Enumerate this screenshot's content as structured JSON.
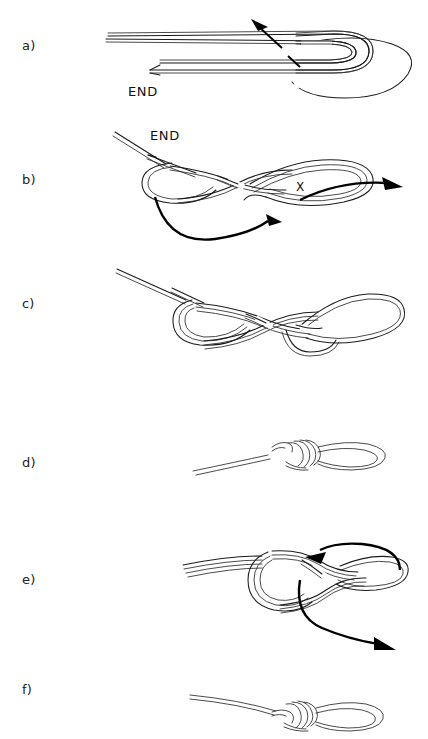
{
  "document": {
    "type": "instructional-line-diagram",
    "subject": "knot tying sequence",
    "clipped_top_caption": "",
    "background_color": "#ffffff",
    "ink_color": "#1b1b1b"
  },
  "panels": [
    {
      "id": "a",
      "label": "a)",
      "label_x": 22,
      "label_y": 38,
      "description": "Doubled rope laid out as a long bight with a loop formed at the right end; free end folded back to the left.",
      "annotations": [
        {
          "name": "end-label",
          "text": "END",
          "x": 128,
          "y": 84
        }
      ],
      "arrows": [
        {
          "name": "pull-arrow",
          "style": "straight",
          "direction": "up-left"
        }
      ]
    },
    {
      "id": "b",
      "label": "b)",
      "label_x": 22,
      "label_y": 172,
      "description": "Doubled rope twisted into interlocking figure-eight crossings; large bight extends to the right.",
      "annotations": [
        {
          "name": "end-label",
          "text": "END",
          "x": 150,
          "y": 128
        },
        {
          "name": "x-marker",
          "text": "X",
          "x": 296,
          "y": 181
        }
      ],
      "arrows": [
        {
          "name": "tuck-arrow-right",
          "style": "curved",
          "direction": "right"
        },
        {
          "name": "sweep-arrow-bottom",
          "style": "curved",
          "direction": "left-to-right-under"
        }
      ]
    },
    {
      "id": "c",
      "label": "c)",
      "label_x": 22,
      "label_y": 296,
      "description": "Crossings drawn closer together; the bight is pulled through forming an elongated loop at the right.",
      "annotations": [],
      "arrows": []
    },
    {
      "id": "d",
      "label": "d)",
      "label_x": 22,
      "label_y": 455,
      "description": "Knot dressed and snugged down to a compact wrapped collar with a short tail and a standing loop.",
      "annotations": [],
      "arrows": []
    },
    {
      "id": "e",
      "label": "e)",
      "label_x": 22,
      "label_y": 572,
      "description": "Close view of the knot being tightened; two curved arrows indicate the directions to pull.",
      "annotations": [],
      "arrows": [
        {
          "name": "tighten-arrow-upper",
          "style": "curved",
          "direction": "up-left"
        },
        {
          "name": "tighten-arrow-lower",
          "style": "curved",
          "direction": "down-right"
        }
      ]
    },
    {
      "id": "f",
      "label": "f)",
      "label_x": 22,
      "label_y": 682,
      "description": "Finished knot: tight wrapped collar with short tail and a clean fixed loop.",
      "annotations": [],
      "arrows": []
    }
  ]
}
